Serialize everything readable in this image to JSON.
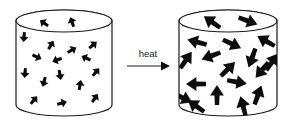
{
  "figure": {
    "background_color": "#ffffff",
    "line_color": "#1a1a1a",
    "particle_color": "#0d0d0d"
  },
  "reaction": {
    "label": "heat",
    "arrow_direction": "right"
  },
  "vessels": [
    {
      "id": "before",
      "name": "cold-gas-container",
      "state_label": "before heating",
      "particle_count": 16,
      "arrow_length_px": 10,
      "arrow_width_px": 4,
      "geometry": {
        "x": 16,
        "y": 10,
        "width": 96,
        "height": 106,
        "ellipse_ry": 11
      },
      "particles": [
        {
          "cx": 44,
          "cy": 23,
          "angle": 215
        },
        {
          "cx": 72,
          "cy": 22,
          "angle": 250
        },
        {
          "cx": 24,
          "cy": 37,
          "angle": 95
        },
        {
          "cx": 93,
          "cy": 45,
          "angle": 320
        },
        {
          "cx": 51,
          "cy": 45,
          "angle": 300
        },
        {
          "cx": 72,
          "cy": 50,
          "angle": 330
        },
        {
          "cx": 86,
          "cy": 58,
          "angle": 205
        },
        {
          "cx": 37,
          "cy": 57,
          "angle": 25
        },
        {
          "cx": 57,
          "cy": 60,
          "angle": 160
        },
        {
          "cx": 25,
          "cy": 73,
          "angle": 95
        },
        {
          "cx": 60,
          "cy": 75,
          "angle": 80
        },
        {
          "cx": 96,
          "cy": 72,
          "angle": 310
        },
        {
          "cx": 44,
          "cy": 82,
          "angle": 105
        },
        {
          "cx": 80,
          "cy": 85,
          "angle": 280
        },
        {
          "cx": 34,
          "cy": 100,
          "angle": 310
        },
        {
          "cx": 62,
          "cy": 103,
          "angle": 345
        },
        {
          "cx": 95,
          "cy": 98,
          "angle": 305
        }
      ]
    },
    {
      "id": "after",
      "name": "hot-gas-container",
      "state_label": "after heating",
      "particle_count": 18,
      "arrow_length_px": 20,
      "arrow_width_px": 6,
      "geometry": {
        "x": 179,
        "y": 10,
        "width": 98,
        "height": 106,
        "ellipse_ry": 11
      },
      "particles": [
        {
          "cx": 212,
          "cy": 22,
          "angle": 215
        },
        {
          "cx": 248,
          "cy": 21,
          "angle": 20
        },
        {
          "cx": 197,
          "cy": 42,
          "angle": 195
        },
        {
          "cx": 232,
          "cy": 44,
          "angle": 25
        },
        {
          "cx": 266,
          "cy": 41,
          "angle": 210
        },
        {
          "cx": 186,
          "cy": 60,
          "angle": 305
        },
        {
          "cx": 211,
          "cy": 56,
          "angle": 160
        },
        {
          "cx": 252,
          "cy": 58,
          "angle": 110
        },
        {
          "cx": 228,
          "cy": 69,
          "angle": 315
        },
        {
          "cx": 262,
          "cy": 70,
          "angle": 130
        },
        {
          "cx": 196,
          "cy": 84,
          "angle": 180
        },
        {
          "cx": 237,
          "cy": 82,
          "angle": 10
        },
        {
          "cx": 217,
          "cy": 95,
          "angle": 270
        },
        {
          "cx": 258,
          "cy": 95,
          "angle": 290
        },
        {
          "cx": 196,
          "cy": 106,
          "angle": 215
        },
        {
          "cx": 243,
          "cy": 106,
          "angle": 255
        },
        {
          "cx": 272,
          "cy": 62,
          "angle": 305
        },
        {
          "cx": 183,
          "cy": 98,
          "angle": 25
        }
      ]
    }
  ]
}
